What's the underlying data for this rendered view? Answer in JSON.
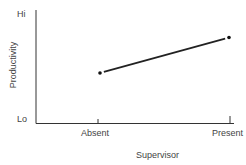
{
  "chart_data": {
    "type": "line",
    "title": "",
    "xlabel": "Supervisor",
    "ylabel": "Productivity",
    "categories": [
      "Absent",
      "Present"
    ],
    "series": [
      {
        "name": "Productivity",
        "values": [
          0.45,
          0.77
        ]
      }
    ],
    "y_tick_labels": [
      "Lo",
      "Hi"
    ],
    "ylim": [
      0,
      1
    ],
    "grid": false,
    "legend": "none"
  },
  "labels": {
    "y_hi": "Hi",
    "y_lo": "Lo",
    "x_absent": "Absent",
    "x_present": "Present",
    "x_axis_title": "Supervisor",
    "y_axis_title": "Productivity"
  }
}
